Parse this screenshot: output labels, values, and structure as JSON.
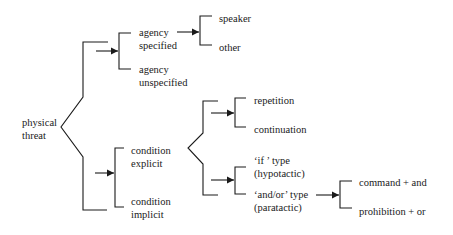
{
  "diagram": {
    "root": {
      "line1": "physical",
      "line2": "threat"
    },
    "agency_specified": {
      "line1": "agency",
      "line2": "specified"
    },
    "agency_unspecified": {
      "line1": "agency",
      "line2": "unspecified"
    },
    "speaker": "speaker",
    "other": "other",
    "condition_explicit": {
      "line1": "condition",
      "line2": "explicit"
    },
    "condition_implicit": {
      "line1": "condition",
      "line2": "implicit"
    },
    "repetition": "repetition",
    "continuation": "continuation",
    "if_type": {
      "line1": "‘if ’ type",
      "line2": "(hypotactic)"
    },
    "and_or_type": {
      "line1": "‘and/or’ type",
      "line2": "(paratactic)"
    },
    "command_and": "command + and",
    "prohibition_or": "prohibition + or"
  },
  "colors": {
    "line": "#1a1a1a",
    "background": "#ffffff"
  }
}
